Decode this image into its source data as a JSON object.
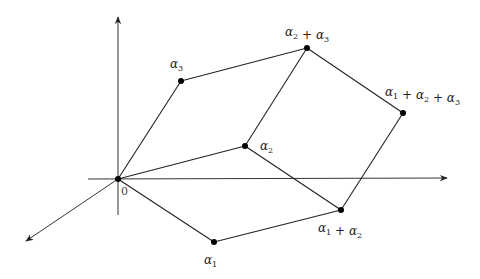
{
  "diagram": {
    "type": "parallelepiped-vectors",
    "axes": {
      "vertical": {
        "from": [
          118,
          215
        ],
        "to": [
          118,
          17
        ]
      },
      "horizontal": {
        "from": [
          88,
          179
        ],
        "to": [
          447,
          178
        ]
      },
      "diagonal": {
        "from": [
          118,
          179
        ],
        "to": [
          26,
          241
        ]
      }
    },
    "origin": {
      "label": "0",
      "pos": [
        118,
        179
      ]
    },
    "points": [
      {
        "id": "a1",
        "base": "α",
        "sub": "1",
        "pos": [
          214,
          242
        ],
        "label_pos": [
          204,
          264
        ]
      },
      {
        "id": "a2",
        "base": "α",
        "sub": "2",
        "pos": [
          245,
          146
        ],
        "label_pos": [
          260,
          150
        ]
      },
      {
        "id": "a3",
        "base": "α",
        "sub": "3",
        "pos": [
          181,
          81
        ],
        "label_pos": [
          170,
          68
        ]
      },
      {
        "id": "a1a2",
        "terms": [
          [
            "α",
            "1"
          ],
          [
            "α",
            "2"
          ]
        ],
        "pos": [
          341,
          210
        ],
        "label_pos": [
          318,
          232
        ]
      },
      {
        "id": "a2a3",
        "terms": [
          [
            "α",
            "2"
          ],
          [
            "α",
            "3"
          ]
        ],
        "pos": [
          307,
          48
        ],
        "label_pos": [
          285,
          36
        ]
      },
      {
        "id": "a1a2a3",
        "terms": [
          [
            "α",
            "1"
          ],
          [
            "α",
            "2"
          ],
          [
            "α",
            "3"
          ]
        ],
        "pos": [
          403,
          113
        ],
        "label_pos": [
          385,
          96
        ]
      }
    ],
    "edges": [
      [
        "origin",
        "a1"
      ],
      [
        "origin",
        "a2"
      ],
      [
        "origin",
        "a3"
      ],
      [
        "a1",
        "a1a2"
      ],
      [
        "a2",
        "a1a2"
      ],
      [
        "a2",
        "a2a3"
      ],
      [
        "a3",
        "a2a3"
      ],
      [
        "a2a3",
        "a1a2a3"
      ],
      [
        "a1a2",
        "a1a2a3"
      ]
    ],
    "colors": {
      "line": "#222222",
      "axis": "#333333",
      "point": "#000000"
    }
  }
}
